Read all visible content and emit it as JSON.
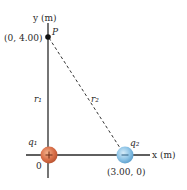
{
  "diagram": {
    "y_axis_label": "y (m)",
    "x_axis_label": "x (m)",
    "point_P": {
      "label": "P",
      "coords": "(0, 4.00)"
    },
    "r1_label": "r₁",
    "r2_label": "r₂",
    "origin_label": "0",
    "charge_q1": {
      "label": "q₁",
      "sign": "+",
      "color": "#d9704a"
    },
    "charge_q2": {
      "label": "q₂",
      "sign": "−",
      "coords": "(3.00, 0)",
      "color": "#7db8e0"
    }
  }
}
